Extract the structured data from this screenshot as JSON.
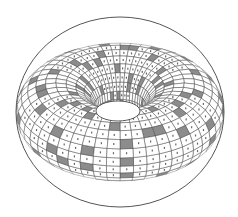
{
  "figure": {
    "background": "#ffffff",
    "line_color": "#4a4a4a",
    "cell_fill": "#ffffff",
    "shaded_cell_fill": "#8c8c8c",
    "hole_fill": "#ffffff",
    "outer": {
      "cx": 120,
      "cy": 112,
      "rx": 104,
      "ry": 95
    },
    "hole": {
      "cx": 118,
      "cy": 111,
      "rx": 22,
      "ry": 10
    },
    "grid": {
      "meridians": 48,
      "parallels": 24
    }
  }
}
